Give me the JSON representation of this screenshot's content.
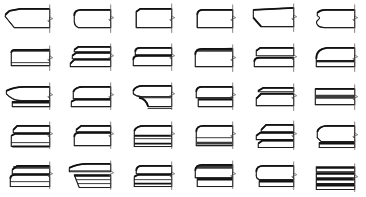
{
  "plate": {
    "title": "Molding Profile Plate",
    "description": "Grid of architectural molding cross-section profiles",
    "columns": 6,
    "rows": 5,
    "total_profiles": 30,
    "background_color": "#ffffff",
    "line_color": "#1a1a1a",
    "shade_color": "#3b3b3b",
    "break_line_color": "#555555"
  },
  "profiles": [
    {
      "id": "r1c1",
      "row": 1,
      "col": 1,
      "name": "chamfered-splay-bullnose",
      "label": ""
    },
    {
      "id": "r1c2",
      "row": 1,
      "col": 2,
      "name": "quarter-round-bullnose",
      "label": ""
    },
    {
      "id": "r1c3",
      "row": 1,
      "col": 3,
      "name": "square-edge-with-top-step",
      "label": ""
    },
    {
      "id": "r1c4",
      "row": 1,
      "col": 4,
      "name": "rounded-nose-with-fillet",
      "label": ""
    },
    {
      "id": "r1c5",
      "row": 1,
      "col": 5,
      "name": "angled-splay-cavetto",
      "label": ""
    },
    {
      "id": "r1c6",
      "row": 1,
      "col": 6,
      "name": "ogee-double-curve-edge",
      "label": ""
    },
    {
      "id": "r2c1",
      "row": 2,
      "col": 1,
      "name": "flat-band-with-shaded-top",
      "label": ""
    },
    {
      "id": "r2c2",
      "row": 2,
      "col": 2,
      "name": "triple-reeded-band",
      "label": ""
    },
    {
      "id": "r2c3",
      "row": 2,
      "col": 3,
      "name": "double-stepped-torus",
      "label": ""
    },
    {
      "id": "r2c4",
      "row": 2,
      "col": 4,
      "name": "heavy-shaded-bullnose",
      "label": ""
    },
    {
      "id": "r2c5",
      "row": 2,
      "col": 5,
      "name": "banded-cavetto-with-fillet",
      "label": ""
    },
    {
      "id": "r2c6",
      "row": 2,
      "col": 6,
      "name": "rounded-cove-with-lower-band",
      "label": ""
    },
    {
      "id": "r3c1",
      "row": 3,
      "col": 1,
      "name": "wide-splayed-cornice-with-soffit",
      "label": ""
    },
    {
      "id": "r3c2",
      "row": 3,
      "col": 2,
      "name": "stepped-cornice-band",
      "label": ""
    },
    {
      "id": "r3c3",
      "row": 3,
      "col": 3,
      "name": "deep-cove-cornice-drop",
      "label": ""
    },
    {
      "id": "r3c4",
      "row": 3,
      "col": 4,
      "name": "short-bullnose-with-drop-fillet",
      "label": ""
    },
    {
      "id": "r3c5",
      "row": 3,
      "col": 5,
      "name": "double-fillet-slab",
      "label": ""
    },
    {
      "id": "r3c6",
      "row": 3,
      "col": 6,
      "name": "flat-slab-with-shadow-line",
      "label": ""
    },
    {
      "id": "r4c1",
      "row": 4,
      "col": 1,
      "name": "stepped-band-with-base-shadow",
      "label": ""
    },
    {
      "id": "r4c2",
      "row": 4,
      "col": 2,
      "name": "narrow-stepped-ovolo",
      "label": ""
    },
    {
      "id": "r4c3",
      "row": 4,
      "col": 3,
      "name": "multi-reeded-splay",
      "label": ""
    },
    {
      "id": "r4c4",
      "row": 4,
      "col": 4,
      "name": "bullnose-with-under-shadow",
      "label": ""
    },
    {
      "id": "r4c5",
      "row": 4,
      "col": 5,
      "name": "z-stepped-double-band",
      "label": ""
    },
    {
      "id": "r4c6",
      "row": 4,
      "col": 6,
      "name": "angled-ovolo-with-base",
      "label": ""
    },
    {
      "id": "r5c1",
      "row": 5,
      "col": 1,
      "name": "shaded-crown-with-reeds",
      "label": ""
    },
    {
      "id": "r5c2",
      "row": 5,
      "col": 2,
      "name": "splayed-crown-with-reeds",
      "label": ""
    },
    {
      "id": "r5c3",
      "row": 5,
      "col": 3,
      "name": "stepped-crown-with-fillets",
      "label": ""
    },
    {
      "id": "r5c4",
      "row": 5,
      "col": 4,
      "name": "heavy-crown-with-base-step",
      "label": ""
    },
    {
      "id": "r5c5",
      "row": 5,
      "col": 5,
      "name": "rounded-crown-with-base-step",
      "label": ""
    },
    {
      "id": "r5c6",
      "row": 5,
      "col": 6,
      "name": "stacked-quadruple-reed-band",
      "label": ""
    }
  ]
}
